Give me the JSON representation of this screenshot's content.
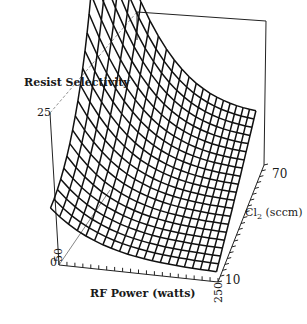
{
  "chart_data": {
    "type": "surface3d",
    "title": "",
    "zlabel": "Resist Selectivity",
    "xlabel": "RF Power (watts)",
    "ylabel": "Cl2 (sccm)",
    "ylabel_main": "Cl",
    "ylabel_sub": "2",
    "ylabel_unit": " (sccm)",
    "x_range": [
      50,
      250
    ],
    "y_range": [
      10,
      70
    ],
    "z_range": [
      0,
      25
    ],
    "x_ticks": [
      "50",
      "250"
    ],
    "y_ticks": [
      "10",
      "70"
    ],
    "z_ticks": [
      "0",
      "25"
    ],
    "grid": false,
    "x_grid_values": [
      50,
      60,
      70,
      80,
      90,
      100,
      110,
      120,
      130,
      140,
      150,
      160,
      170,
      180,
      190,
      200,
      210,
      220,
      230,
      240,
      250
    ],
    "y_grid_values": [
      10,
      13,
      16,
      19,
      22,
      25,
      28,
      31,
      34,
      37,
      40,
      43,
      46,
      49,
      52,
      55,
      58,
      61,
      64,
      67,
      70
    ],
    "surface_description": "Wireframe surface; selectivity highest (~25+) at low RF power and high Cl2, decreasing steeply with RF power to a minimum near ~5 at high RF power; weak increase with Cl2.",
    "corner_values": {
      "rf50_cl10": 10,
      "rf50_cl70": 26,
      "rf250_cl10": 2,
      "rf250_cl70": 8
    }
  }
}
